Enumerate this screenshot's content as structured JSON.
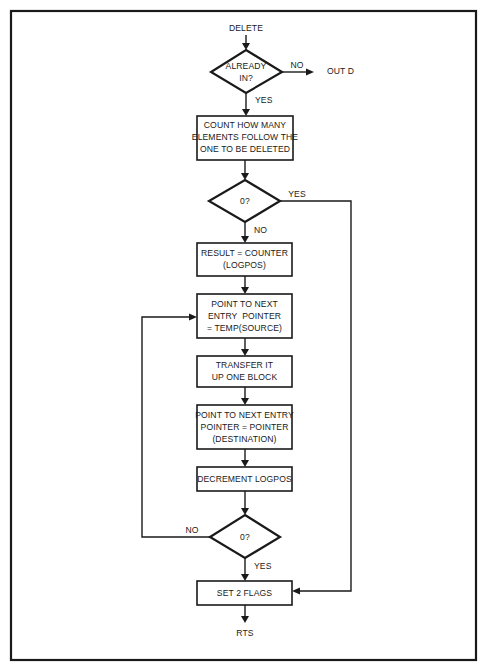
{
  "flowchart": {
    "title": "DELETE",
    "nodes": {
      "start": "DELETE",
      "decision_already_in": [
        "ALREADY",
        "IN?"
      ],
      "out_d": "OUT D",
      "count_box": [
        "COUNT HOW MANY",
        "ELEMENTS FOLLOW THE",
        "ONE TO BE DELETED"
      ],
      "decision_zero_1": "0?",
      "result_box": [
        "RESULT = COUNTER",
        "(LOGPOS)"
      ],
      "point_source_box": [
        "POINT TO NEXT",
        "ENTRY  POINTER",
        "= TEMP(SOURCE)"
      ],
      "transfer_box": [
        "TRANSFER IT",
        "UP ONE BLOCK"
      ],
      "point_dest_box": [
        "POINT TO NEXT ENTRY",
        "POINTER = POINTER",
        "(DESTINATION)"
      ],
      "decrement_box": "DECREMENT LOGPOS",
      "decision_zero_2": "0?",
      "set_flags_box": "SET 2 FLAGS",
      "end": "RTS"
    },
    "edge_labels": {
      "already_in_no": "NO",
      "already_in_yes": "YES",
      "zero1_yes": "YES",
      "zero1_no": "NO",
      "zero2_no": "NO",
      "zero2_yes": "YES"
    },
    "colors": {
      "ink": "#1a1a1a",
      "paper": "#ffffff"
    }
  }
}
